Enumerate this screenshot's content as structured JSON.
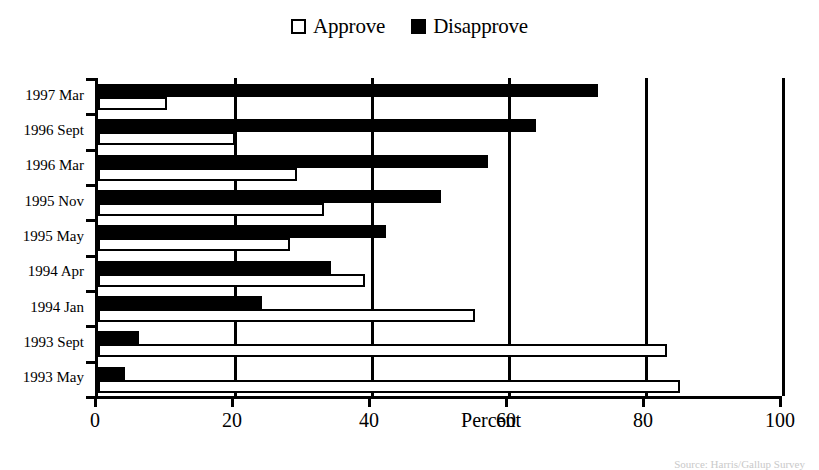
{
  "legend": {
    "position": "top-center",
    "entries": [
      {
        "label": "Approve",
        "style": "hollow",
        "swatch_name": "approve-swatch"
      },
      {
        "label": "Disapprove",
        "style": "filled",
        "swatch_name": "disapprove-swatch"
      }
    ]
  },
  "axis": {
    "x_title": "Percent",
    "x_ticks": [
      "0",
      "20",
      "40",
      "60",
      "80",
      "100"
    ],
    "x_tick_values": [
      0,
      20,
      40,
      60,
      80,
      100
    ],
    "x_min": 0,
    "x_max": 100,
    "gridlines_at": [
      20,
      40,
      60,
      80,
      100
    ]
  },
  "source": {
    "text": "Source: Harris/Gallup Survey"
  },
  "chart_data": {
    "type": "bar",
    "orientation": "horizontal",
    "title": "",
    "subtitle": "",
    "xlabel": "Percent",
    "ylabel": "",
    "xlim": [
      0,
      100
    ],
    "grid": true,
    "legend_position": "top-center",
    "categories": [
      "1997 Mar",
      "1996 Sept",
      "1996 Mar",
      "1995 Nov",
      "1995 May",
      "1994 Apr",
      "1994 Jan",
      "1993 Sept",
      "1993 May"
    ],
    "series": [
      {
        "name": "Approve",
        "color": "#ffffff",
        "values": [
          10,
          20,
          29,
          33,
          28,
          39,
          55,
          83,
          85
        ]
      },
      {
        "name": "Disapprove",
        "color": "#000000",
        "values": [
          73,
          64,
          57,
          50,
          42,
          34,
          24,
          6,
          4
        ]
      }
    ]
  }
}
